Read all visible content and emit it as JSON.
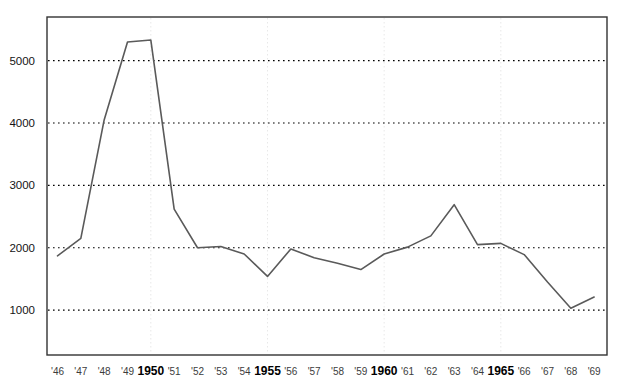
{
  "caption": "",
  "chart_data": {
    "type": "line",
    "title": "",
    "subtitle": "",
    "xlabel": "",
    "ylabel": "",
    "x": [
      1946,
      1947,
      1948,
      1949,
      1950,
      1951,
      1952,
      1953,
      1954,
      1955,
      1956,
      1957,
      1958,
      1959,
      1960,
      1961,
      1962,
      1963,
      1964,
      1965,
      1966,
      1967,
      1968,
      1969
    ],
    "xtick_labels": [
      "'46",
      "'47",
      "'48",
      "'49",
      "1950",
      "'51",
      "'52",
      "'53",
      "'54",
      "1955",
      "'56",
      "'57",
      "'58",
      "'59",
      "1960",
      "'61",
      "'62",
      "'63",
      "'64",
      "1965",
      "'66",
      "'67",
      "'68",
      "'69"
    ],
    "xtick_major": [
      false,
      false,
      false,
      false,
      true,
      false,
      false,
      false,
      false,
      true,
      false,
      false,
      false,
      false,
      true,
      false,
      false,
      false,
      false,
      true,
      false,
      false,
      false,
      false
    ],
    "values": [
      1870,
      2150,
      4050,
      5300,
      5330,
      2620,
      2000,
      2020,
      1900,
      1540,
      1980,
      1840,
      1750,
      1650,
      1900,
      2010,
      2190,
      2690,
      2050,
      2070,
      1890,
      1450,
      1030,
      1210
    ],
    "ytick_values": [
      1000,
      2000,
      3000,
      4000,
      5000
    ],
    "ytick_labels": [
      "1000",
      "2000",
      "3000",
      "4000",
      "5000"
    ],
    "ylim": [
      280,
      5700
    ],
    "xlim": [
      1945.55,
      1969.55
    ],
    "grid": {
      "horizontal": true,
      "horizontal_style": "dotted",
      "horizontal_color": "#000000",
      "vertical": true,
      "vertical_style": "dotted",
      "vertical_color": "#e8e8e8",
      "vertical_at": [
        1950,
        1955,
        1960,
        1965
      ]
    },
    "legend": null,
    "line_color": "#5a5a5a",
    "line_width": 1.6,
    "frame_color": "#333333",
    "background": "#ffffff"
  }
}
